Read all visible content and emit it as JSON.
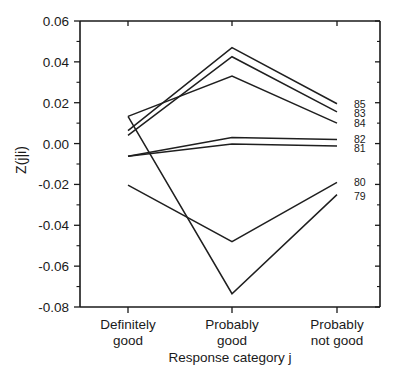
{
  "chart_data": {
    "type": "line",
    "title": "",
    "xlabel": "Response category j",
    "ylabel": "Z(j|i)",
    "categories": [
      "Definitely good",
      "Probably good",
      "Probably not good"
    ],
    "category_lines": [
      [
        "Definitely",
        "good"
      ],
      [
        "Probably",
        "good"
      ],
      [
        "Probably",
        "not good"
      ]
    ],
    "ylim": [
      -0.08,
      0.06
    ],
    "yticks": [
      0.06,
      0.04,
      0.02,
      0.0,
      -0.02,
      -0.04,
      -0.06,
      -0.08
    ],
    "ytick_labels": [
      "0.06",
      "0.04",
      "0.02",
      "0.00",
      "-0.02",
      "-0.04",
      "-0.06",
      "-0.08"
    ],
    "minor_ticks": true,
    "grid": false,
    "legend": "right-inline",
    "series": [
      {
        "name": "85",
        "values": [
          0.0063,
          0.047,
          0.0195
        ]
      },
      {
        "name": "83",
        "values": [
          0.004,
          0.0425,
          0.0155
        ]
      },
      {
        "name": "84",
        "values": [
          0.0133,
          0.033,
          0.01
        ]
      },
      {
        "name": "82",
        "values": [
          -0.0062,
          0.003,
          0.002
        ]
      },
      {
        "name": "81",
        "values": [
          -0.0062,
          -0.0002,
          -0.0012
        ]
      },
      {
        "name": "80",
        "values": [
          -0.0203,
          -0.048,
          -0.019
        ]
      },
      {
        "name": "79",
        "values": [
          0.0133,
          -0.0735,
          -0.025
        ]
      }
    ],
    "label_positions": [
      {
        "name": "85",
        "y": 0.0195
      },
      {
        "name": "83",
        "y": 0.015
      },
      {
        "name": "84",
        "y": 0.0102
      },
      {
        "name": "82",
        "y": 0.0022
      },
      {
        "name": "81",
        "y": -0.002
      },
      {
        "name": "80",
        "y": -0.019
      },
      {
        "name": "79",
        "y": -0.0258
      }
    ],
    "colors": {
      "line": "#1f1f1f",
      "axis": "#1a1a1a",
      "background": "#ffffff"
    }
  }
}
